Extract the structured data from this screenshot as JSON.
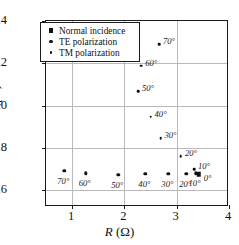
{
  "chart_data": {
    "type": "scatter",
    "title": "",
    "xlabel": "R (Ω)",
    "ylabel": "C (pF)",
    "xlim": [
      0.5,
      4.0
    ],
    "ylim": [
      1.52,
      2.4
    ],
    "xticks": [
      "1",
      "2",
      "3",
      "4"
    ],
    "xtick_values": [
      1,
      2,
      3,
      4
    ],
    "yticks": [
      "1.6",
      "1.8",
      "2.0",
      "2.2",
      "2.4"
    ],
    "ytick_values": [
      1.6,
      1.8,
      2.0,
      2.2,
      2.4
    ],
    "grid": true,
    "legend_position": "upper-left-inside",
    "series": [
      {
        "name": "Normal incidence",
        "marker": "square",
        "points": [
          {
            "x": 3.42,
            "y": 1.675,
            "label": "0°"
          }
        ]
      },
      {
        "name": "TE polarization",
        "marker": "circle-medium",
        "points": [
          {
            "x": 0.85,
            "y": 1.69,
            "label": "70°"
          },
          {
            "x": 1.26,
            "y": 1.68,
            "label": "60°"
          },
          {
            "x": 1.88,
            "y": 1.673,
            "label": "50°"
          },
          {
            "x": 2.4,
            "y": 1.677,
            "label": "40°"
          },
          {
            "x": 2.84,
            "y": 1.676,
            "label": "30°"
          },
          {
            "x": 3.18,
            "y": 1.678,
            "label": "20°"
          },
          {
            "x": 3.36,
            "y": 1.68,
            "label": "10°"
          }
        ]
      },
      {
        "name": "TM polarization",
        "marker": "circle-small",
        "points": [
          {
            "x": 2.66,
            "y": 2.29,
            "label": "70°"
          },
          {
            "x": 2.32,
            "y": 2.188,
            "label": "60°"
          },
          {
            "x": 2.26,
            "y": 2.068,
            "label": "50°"
          },
          {
            "x": 2.5,
            "y": 1.948,
            "label": "40°"
          },
          {
            "x": 2.69,
            "y": 1.845,
            "label": "30°"
          },
          {
            "x": 3.08,
            "y": 1.76,
            "label": "20°"
          },
          {
            "x": 3.33,
            "y": 1.7,
            "label": "10°"
          }
        ]
      }
    ]
  },
  "legend": {
    "entries": [
      {
        "label": "Normal incidence",
        "marker": "square"
      },
      {
        "label": "TE polarization",
        "marker": "circle-medium"
      },
      {
        "label": "TM polarization",
        "marker": "circle-small"
      }
    ]
  },
  "axis_titles": {
    "x_symbol": "R",
    "x_unit": " (Ω)",
    "y_symbol": "C",
    "y_unit": " (pF)"
  },
  "colors": {
    "marker": "#111111",
    "grid": "#b9b9b9",
    "frame": "#1a1a1a",
    "background": "#ffffff"
  }
}
